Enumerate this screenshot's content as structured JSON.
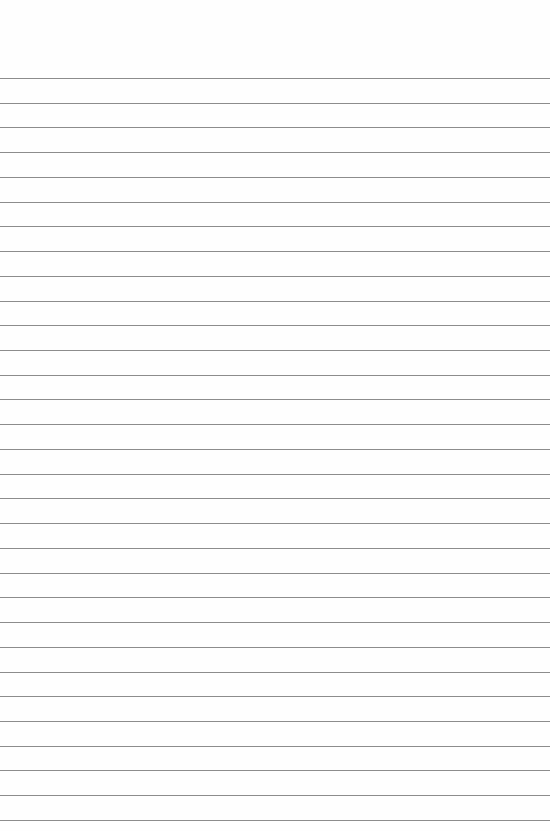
{
  "paper": {
    "type": "lined-paper",
    "background_color": "#fefefe",
    "line_color": "#8c8c8c",
    "first_line_y": 78,
    "line_spacing": 24.73,
    "line_count": 31
  }
}
